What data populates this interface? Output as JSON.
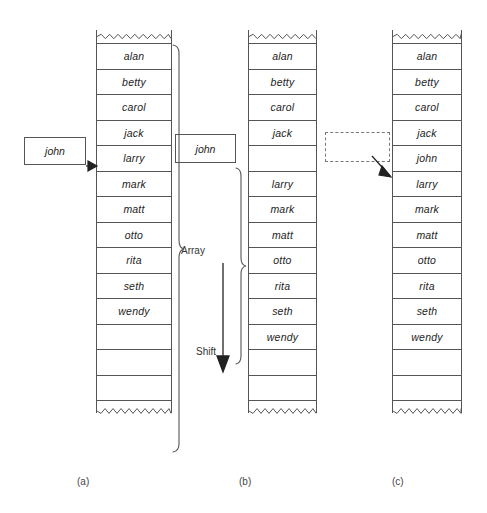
{
  "figure": {
    "caption_a": "(a)",
    "caption_b": "(b)",
    "caption_c": "(c)",
    "label_array": "Array",
    "label_shift": "Shift",
    "line_color": "#555555",
    "text_color": "#1d1d1d",
    "background": "#ffffff"
  },
  "panel_a": {
    "name": "before-insertion",
    "input_box": {
      "value": "john",
      "style": "solid"
    },
    "cells": [
      {
        "value": "alan"
      },
      {
        "value": "betty"
      },
      {
        "value": "carol"
      },
      {
        "value": "jack"
      },
      {
        "value": "larry"
      },
      {
        "value": "mark"
      },
      {
        "value": "matt"
      },
      {
        "value": "otto"
      },
      {
        "value": "rita"
      },
      {
        "value": "seth"
      },
      {
        "value": "wendy"
      },
      {
        "value": ""
      },
      {
        "value": ""
      },
      {
        "value": ""
      }
    ]
  },
  "panel_b": {
    "name": "during-shift",
    "input_box": {
      "value": "john",
      "style": "solid"
    },
    "cells": [
      {
        "value": "alan"
      },
      {
        "value": "betty"
      },
      {
        "value": "carol"
      },
      {
        "value": "jack"
      },
      {
        "value": ""
      },
      {
        "value": "larry"
      },
      {
        "value": "mark"
      },
      {
        "value": "matt"
      },
      {
        "value": "otto"
      },
      {
        "value": "rita"
      },
      {
        "value": "seth"
      },
      {
        "value": "wendy"
      },
      {
        "value": ""
      },
      {
        "value": ""
      }
    ]
  },
  "panel_c": {
    "name": "after-insertion",
    "input_box": {
      "value": "",
      "style": "dashed"
    },
    "cells": [
      {
        "value": "alan"
      },
      {
        "value": "betty"
      },
      {
        "value": "carol"
      },
      {
        "value": "jack"
      },
      {
        "value": "john"
      },
      {
        "value": "larry"
      },
      {
        "value": "mark"
      },
      {
        "value": "matt"
      },
      {
        "value": "otto"
      },
      {
        "value": "rita"
      },
      {
        "value": "seth"
      },
      {
        "value": "wendy"
      },
      {
        "value": ""
      },
      {
        "value": ""
      }
    ]
  }
}
